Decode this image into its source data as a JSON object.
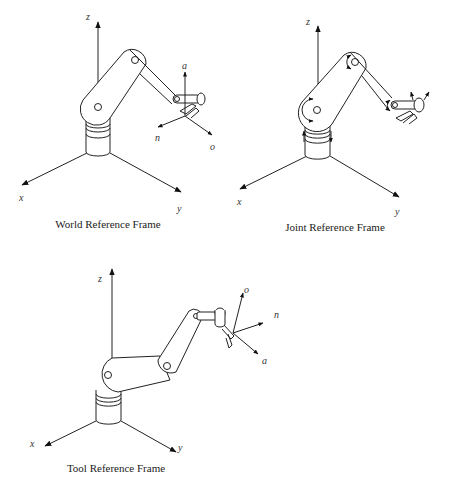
{
  "figures": [
    {
      "id": "world",
      "caption": "World Reference Frame",
      "axes": {
        "z": "z",
        "x": "x",
        "y": "y"
      },
      "tool_axes": {
        "a": "a",
        "n": "n",
        "o": "o"
      }
    },
    {
      "id": "joint",
      "caption": "Joint Reference Frame",
      "axes": {
        "z": "z",
        "x": "x",
        "y": "y"
      }
    },
    {
      "id": "tool",
      "caption": "Tool Reference Frame",
      "axes": {
        "z": "z",
        "x": "x",
        "y": "y"
      },
      "tool_axes": {
        "o": "o",
        "n": "n",
        "a": "a"
      }
    }
  ],
  "colors": {
    "line": "#222222",
    "background": "#ffffff"
  }
}
